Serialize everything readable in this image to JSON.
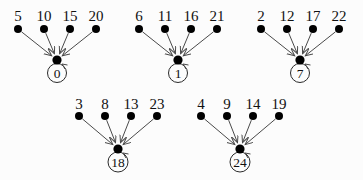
{
  "diagram": {
    "width": 363,
    "height": 180,
    "colors": {
      "background": "#fcfcfc",
      "node_fill": "#000000",
      "edge_stroke": "#4a4a4a",
      "circle_stroke": "#2a2a2a",
      "text": "#111111"
    },
    "font": {
      "leaf_label_size": 15,
      "hub_label_size": 13.5
    },
    "groups": [
      {
        "leaves": [
          "5",
          "10",
          "15",
          "20"
        ],
        "center": "0"
      },
      {
        "leaves": [
          "6",
          "11",
          "16",
          "21"
        ],
        "center": "1"
      },
      {
        "leaves": [
          "2",
          "12",
          "17",
          "22"
        ],
        "center": "7"
      },
      {
        "leaves": [
          "3",
          "8",
          "13",
          "23"
        ],
        "center": "18"
      },
      {
        "leaves": [
          "4",
          "9",
          "14",
          "19"
        ],
        "center": "24"
      }
    ],
    "layout": {
      "group_cx": [
        57,
        178,
        300,
        118,
        240
      ],
      "group_row": [
        0,
        0,
        0,
        1,
        1
      ],
      "leaf_spacing": 26,
      "rows": [
        {
          "label_baseline_y": 21,
          "leaf_y": 29,
          "hub_y": 60,
          "circle_cy": 73,
          "circle_r": 9.5
        },
        {
          "label_baseline_y": 109,
          "leaf_y": 116,
          "hub_y": 149,
          "circle_cy": 162,
          "circle_r": 10
        }
      ],
      "leaf_dot_r": 4,
      "hub_dot_r": 4.6
    }
  }
}
